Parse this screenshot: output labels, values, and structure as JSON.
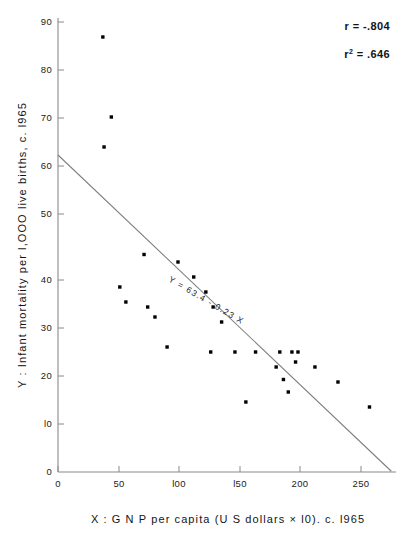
{
  "chart_data": {
    "type": "scatter",
    "title": "",
    "xlabel": "X :  G N P   per  capita  (U S   dollars  ×  l0).  c.  l965",
    "ylabel": "Y :  Infant  mortality  per  l,OOO  live  births,  c.  l965",
    "xlim": [
      0,
      275
    ],
    "ylim": [
      0,
      92
    ],
    "xticks": [
      0,
      50,
      100,
      150,
      200,
      250
    ],
    "xticklabels": [
      "0",
      "50",
      "l00",
      "l50",
      "200",
      "250"
    ],
    "yticks": [
      0,
      10,
      20,
      30,
      40,
      50,
      60,
      70,
      80,
      90
    ],
    "yticklabels": [
      "0",
      "l0",
      "20",
      "30",
      "40",
      "50",
      "60",
      "70",
      "80",
      "90"
    ],
    "grid": false,
    "legend": null,
    "marker": "square",
    "marker_color": "#000000",
    "points": [
      {
        "x": 37,
        "y": 87
      },
      {
        "x": 44,
        "y": 71
      },
      {
        "x": 38,
        "y": 65
      },
      {
        "x": 51,
        "y": 37
      },
      {
        "x": 56,
        "y": 34
      },
      {
        "x": 71,
        "y": 43.5
      },
      {
        "x": 74,
        "y": 33
      },
      {
        "x": 80,
        "y": 31
      },
      {
        "x": 90,
        "y": 25
      },
      {
        "x": 99,
        "y": 42
      },
      {
        "x": 112,
        "y": 39
      },
      {
        "x": 122,
        "y": 36
      },
      {
        "x": 126,
        "y": 24
      },
      {
        "x": 128,
        "y": 33
      },
      {
        "x": 135,
        "y": 30
      },
      {
        "x": 146,
        "y": 24
      },
      {
        "x": 155,
        "y": 14
      },
      {
        "x": 163,
        "y": 24
      },
      {
        "x": 180,
        "y": 21
      },
      {
        "x": 183,
        "y": 24
      },
      {
        "x": 186,
        "y": 18.5
      },
      {
        "x": 190,
        "y": 16
      },
      {
        "x": 193,
        "y": 24
      },
      {
        "x": 198,
        "y": 24
      },
      {
        "x": 196,
        "y": 22
      },
      {
        "x": 212,
        "y": 21
      },
      {
        "x": 231,
        "y": 18
      },
      {
        "x": 257,
        "y": 13
      }
    ],
    "fit_line": {
      "equation": "Y = 63.4 - 0.23 X",
      "intercept": 63.4,
      "slope": -0.23,
      "x_start": 0,
      "x_end": 275,
      "color": "#7d7d7d"
    },
    "annotations": {
      "r_label": "r = -.804",
      "r2_label_base": "r",
      "r2_label_sup": "2",
      "r2_label_rest": " = .646",
      "r_value": -0.804,
      "r2_value": 0.646,
      "equation_label": "Y = 63.4 - 0.23 X"
    }
  }
}
